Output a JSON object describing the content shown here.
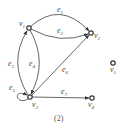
{
  "diagram": {
    "type": "directed-graph",
    "caption": "(2)",
    "nodes": [
      {
        "id": "v1",
        "label": "v",
        "sub": "1"
      },
      {
        "id": "v2",
        "label": "v",
        "sub": "2"
      },
      {
        "id": "v3",
        "label": "v",
        "sub": "3"
      },
      {
        "id": "v4",
        "label": "v",
        "sub": "4"
      },
      {
        "id": "v5",
        "label": "v",
        "sub": "5"
      }
    ],
    "edges": [
      {
        "id": "e1",
        "label": "e",
        "sub": "1",
        "from": "v1",
        "to": "v2"
      },
      {
        "id": "e2",
        "label": "e",
        "sub": "2",
        "from": "v1",
        "to": "v2"
      },
      {
        "id": "e3",
        "label": "e",
        "sub": "3",
        "from": "v3",
        "to": "v1"
      },
      {
        "id": "e4",
        "label": "e",
        "sub": "4",
        "from": "v1",
        "to": "v3"
      },
      {
        "id": "e5",
        "label": "e",
        "sub": "5",
        "from": "v3",
        "to": "v3"
      },
      {
        "id": "e6",
        "label": "e",
        "sub": "6",
        "from": "v3",
        "to": "v2"
      },
      {
        "id": "e7",
        "label": "e",
        "sub": "7",
        "from": "v3",
        "to": "v4"
      }
    ]
  }
}
